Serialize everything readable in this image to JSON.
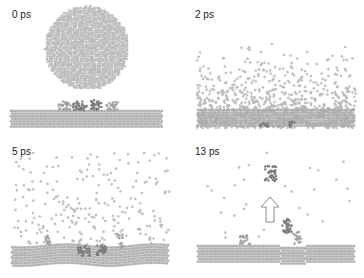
{
  "figure": {
    "colors": {
      "background": "#ffffff",
      "atom_light": "#c8c8c8",
      "atom_stroke": "#9a9a9a",
      "substrate": "#b4b4b4",
      "molecule_dark": "#6e6e6e",
      "molecule_light": "#a8a8a8",
      "arrow_stroke": "#8a8a8a",
      "label": "#222222"
    },
    "panels": [
      {
        "id": "p0",
        "time_label": "0 ps",
        "state": "projectile sphere above intact substrate with adsorbed molecules"
      },
      {
        "id": "p1",
        "time_label": "2 ps",
        "state": "projectile fragmented, dense splash over surface"
      },
      {
        "id": "p2",
        "time_label": "5 ps",
        "state": "atoms sputtering upward, surface cratered, molecules embedded"
      },
      {
        "id": "p3",
        "time_label": "13 ps",
        "state": "molecule ejected upward, indicated by arrow",
        "arrow": "up-arrow"
      }
    ]
  }
}
